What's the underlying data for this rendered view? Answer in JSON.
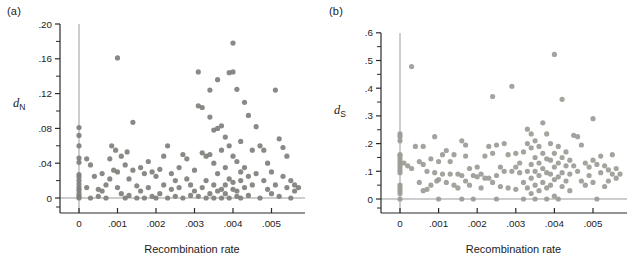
{
  "chart_data": [
    {
      "type": "scatter",
      "panel_label": "(a)",
      "xlabel": "Recombination rate",
      "ylabel_base": "d",
      "ylabel_sub": "N",
      "xlim": [
        -0.0005,
        0.0059
      ],
      "ylim": [
        -0.02,
        0.2
      ],
      "grid": false,
      "legend": "none",
      "zero_reference_lines": true,
      "xticks": {
        "values": [
          0,
          0.001,
          0.002,
          0.003,
          0.004,
          0.005
        ],
        "labels": [
          "0",
          ".001",
          ".002",
          ".003",
          ".004",
          ".005"
        ]
      },
      "yticks": {
        "values": [
          0,
          0.04,
          0.08,
          0.12,
          0.16,
          0.2
        ],
        "labels": [
          "0",
          ".04",
          ".08",
          ".12",
          ".16",
          ".20"
        ],
        "minor_step": 0.02
      },
      "dot_color": "#7f7f7b",
      "axis_color": "#2a2a2a",
      "zero_line_color": "#9b9b9b",
      "points": [
        [
          0,
          0.081
        ],
        [
          0,
          0.072
        ],
        [
          0,
          0.06
        ],
        [
          0,
          0.046
        ],
        [
          0,
          0.041
        ],
        [
          0,
          0.027
        ],
        [
          0,
          0.024
        ],
        [
          0,
          0.02
        ],
        [
          0,
          0.016
        ],
        [
          0,
          0.012
        ],
        [
          0,
          0.009
        ],
        [
          0,
          0.005
        ],
        [
          0,
          0.002
        ],
        [
          0,
          0.0
        ],
        [
          0.0002,
          0.045
        ],
        [
          0.0002,
          0.012
        ],
        [
          0.0003,
          0.038
        ],
        [
          0.0003,
          0.0
        ],
        [
          0.0004,
          0.025
        ],
        [
          0.0005,
          0.01
        ],
        [
          0.0005,
          0.002
        ],
        [
          0.0006,
          0.028
        ],
        [
          0.0006,
          0.008
        ],
        [
          0.0007,
          0.015
        ],
        [
          0.0007,
          0.0
        ],
        [
          0.0008,
          0.045
        ],
        [
          0.0008,
          0.022
        ],
        [
          0.00085,
          0.06
        ],
        [
          0.0009,
          0.032
        ],
        [
          0.00095,
          0.055
        ],
        [
          0.001,
          0.161
        ],
        [
          0.001,
          0.03
        ],
        [
          0.001,
          0.012
        ],
        [
          0.0011,
          0.048
        ],
        [
          0.0011,
          0.005
        ],
        [
          0.0012,
          0.038
        ],
        [
          0.0012,
          0.0
        ],
        [
          0.00125,
          0.053
        ],
        [
          0.0013,
          0.022
        ],
        [
          0.0013,
          0.003
        ],
        [
          0.0014,
          0.087
        ],
        [
          0.0014,
          0.032
        ],
        [
          0.0015,
          0.014
        ],
        [
          0.0015,
          0.0
        ],
        [
          0.0016,
          0.035
        ],
        [
          0.0016,
          0.008
        ],
        [
          0.0017,
          0.028
        ],
        [
          0.0017,
          0.0
        ],
        [
          0.0018,
          0.042
        ],
        [
          0.0018,
          0.012
        ],
        [
          0.0019,
          0.03
        ],
        [
          0.0019,
          0.002
        ],
        [
          0.002,
          0.025
        ],
        [
          0.002,
          0.0
        ],
        [
          0.0021,
          0.033
        ],
        [
          0.0021,
          0.005
        ],
        [
          0.0022,
          0.048
        ],
        [
          0.0022,
          0.015
        ],
        [
          0.0023,
          0.06
        ],
        [
          0.0023,
          0.0
        ],
        [
          0.0024,
          0.028
        ],
        [
          0.0024,
          0.01
        ],
        [
          0.0025,
          0.02
        ],
        [
          0.0025,
          0.002
        ],
        [
          0.0026,
          0.035
        ],
        [
          0.0026,
          0.012
        ],
        [
          0.0027,
          0.05
        ],
        [
          0.0027,
          0.0
        ],
        [
          0.0028,
          0.045
        ],
        [
          0.0028,
          0.022
        ],
        [
          0.0029,
          0.015
        ],
        [
          0.0029,
          0.003
        ],
        [
          0.003,
          0.032
        ],
        [
          0.003,
          0.008
        ],
        [
          0.0031,
          0.145
        ],
        [
          0.0031,
          0.106
        ],
        [
          0.0031,
          0.002
        ],
        [
          0.0032,
          0.104
        ],
        [
          0.0032,
          0.052
        ],
        [
          0.0032,
          0.012
        ],
        [
          0.0033,
          0.048
        ],
        [
          0.0033,
          0.02
        ],
        [
          0.0033,
          0.0
        ],
        [
          0.0034,
          0.124
        ],
        [
          0.0034,
          0.093
        ],
        [
          0.0034,
          0.05
        ],
        [
          0.0034,
          0.005
        ],
        [
          0.0035,
          0.078
        ],
        [
          0.0035,
          0.04
        ],
        [
          0.0035,
          0.015
        ],
        [
          0.0035,
          0.0
        ],
        [
          0.0036,
          0.136
        ],
        [
          0.0036,
          0.08
        ],
        [
          0.0036,
          0.028
        ],
        [
          0.0036,
          0.008
        ],
        [
          0.0037,
          0.083
        ],
        [
          0.0037,
          0.055
        ],
        [
          0.0037,
          0.01
        ],
        [
          0.0037,
          0.0
        ],
        [
          0.0038,
          0.07
        ],
        [
          0.0038,
          0.035
        ],
        [
          0.0038,
          0.015
        ],
        [
          0.0038,
          0.005
        ],
        [
          0.0039,
          0.144
        ],
        [
          0.0039,
          0.06
        ],
        [
          0.0039,
          0.022
        ],
        [
          0.0039,
          0.0
        ],
        [
          0.004,
          0.178
        ],
        [
          0.004,
          0.145
        ],
        [
          0.004,
          0.048
        ],
        [
          0.004,
          0.018
        ],
        [
          0.004,
          0.01
        ],
        [
          0.0041,
          0.125
        ],
        [
          0.0041,
          0.042
        ],
        [
          0.0041,
          0.008
        ],
        [
          0.0041,
          0.002
        ],
        [
          0.0042,
          0.065
        ],
        [
          0.0042,
          0.03
        ],
        [
          0.0042,
          0.02
        ],
        [
          0.0042,
          0.0
        ],
        [
          0.0043,
          0.11
        ],
        [
          0.0043,
          0.035
        ],
        [
          0.0043,
          0.012
        ],
        [
          0.0044,
          0.095
        ],
        [
          0.0044,
          0.025
        ],
        [
          0.0044,
          0.003
        ],
        [
          0.0045,
          0.055
        ],
        [
          0.0045,
          0.015
        ],
        [
          0.0046,
          0.082
        ],
        [
          0.0046,
          0.028
        ],
        [
          0.0047,
          0.06
        ],
        [
          0.0047,
          0.0
        ],
        [
          0.0048,
          0.055
        ],
        [
          0.0048,
          0.02
        ],
        [
          0.0049,
          0.04
        ],
        [
          0.0049,
          0.01
        ],
        [
          0.005,
          0.03
        ],
        [
          0.005,
          0.005
        ],
        [
          0.0051,
          0.124
        ],
        [
          0.0051,
          0.015
        ],
        [
          0.0052,
          0.068
        ],
        [
          0.0052,
          0.002
        ],
        [
          0.0053,
          0.058
        ],
        [
          0.0053,
          0.025
        ],
        [
          0.0054,
          0.048
        ],
        [
          0.0054,
          0.012
        ],
        [
          0.0055,
          0.02
        ],
        [
          0.0055,
          0.0
        ],
        [
          0.0056,
          0.015
        ],
        [
          0.0056,
          0.008
        ],
        [
          0.0057,
          0.012
        ]
      ]
    },
    {
      "type": "scatter",
      "panel_label": "(b)",
      "xlabel": "Recombination rate",
      "ylabel_base": "d",
      "ylabel_sub": "S",
      "xlim": [
        -0.0005,
        0.0059
      ],
      "ylim": [
        -0.06,
        0.6
      ],
      "grid": false,
      "legend": "none",
      "zero_reference_lines": true,
      "xticks": {
        "values": [
          0,
          0.001,
          0.002,
          0.003,
          0.004,
          0.005
        ],
        "labels": [
          "0",
          ".001",
          ".002",
          ".003",
          ".004",
          ".005"
        ]
      },
      "yticks": {
        "values": [
          0,
          0.1,
          0.2,
          0.3,
          0.4,
          0.5,
          0.6
        ],
        "labels": [
          "0",
          ".1",
          ".2",
          ".3",
          ".4",
          ".5",
          ".6"
        ],
        "minor_step": 0.05
      },
      "dot_color": "#9c9c96",
      "axis_color": "#2a2a2a",
      "zero_line_color": "#9b9b9b",
      "points": [
        [
          0,
          0.235
        ],
        [
          0,
          0.225
        ],
        [
          0,
          0.21
        ],
        [
          0,
          0.16
        ],
        [
          0,
          0.155
        ],
        [
          0,
          0.145
        ],
        [
          0,
          0.135
        ],
        [
          0,
          0.125
        ],
        [
          0,
          0.115
        ],
        [
          0,
          0.105
        ],
        [
          0,
          0.095
        ],
        [
          0,
          0.05
        ],
        [
          0,
          0.04
        ],
        [
          0,
          0.03
        ],
        [
          0,
          0.02
        ],
        [
          0,
          0.0
        ],
        [
          0.0001,
          0.13
        ],
        [
          0.0002,
          0.12
        ],
        [
          0.0003,
          0.478
        ],
        [
          0.0003,
          0.11
        ],
        [
          0.0004,
          0.19
        ],
        [
          0.0005,
          0.135
        ],
        [
          0.0005,
          0.06
        ],
        [
          0.0006,
          0.19
        ],
        [
          0.0006,
          0.125
        ],
        [
          0.0006,
          0.03
        ],
        [
          0.0007,
          0.1
        ],
        [
          0.0007,
          0.035
        ],
        [
          0.0008,
          0.145
        ],
        [
          0.0008,
          0.05
        ],
        [
          0.0009,
          0.225
        ],
        [
          0.0009,
          0.095
        ],
        [
          0.00095,
          0.065
        ],
        [
          0.001,
          0.135
        ],
        [
          0.001,
          0.07
        ],
        [
          0.001,
          0.0
        ],
        [
          0.0011,
          0.16
        ],
        [
          0.0011,
          0.09
        ],
        [
          0.0012,
          0.175
        ],
        [
          0.0012,
          0.06
        ],
        [
          0.0013,
          0.135
        ],
        [
          0.0013,
          0.09
        ],
        [
          0.0014,
          0.16
        ],
        [
          0.0014,
          0.05
        ],
        [
          0.0015,
          0.09
        ],
        [
          0.0015,
          0.04
        ],
        [
          0.0016,
          0.21
        ],
        [
          0.0016,
          0.085
        ],
        [
          0.0016,
          0.0
        ],
        [
          0.0017,
          0.195
        ],
        [
          0.0017,
          0.155
        ],
        [
          0.0017,
          0.065
        ],
        [
          0.0018,
          0.11
        ],
        [
          0.0018,
          0.05
        ],
        [
          0.0019,
          0.085
        ],
        [
          0.0019,
          0.0
        ],
        [
          0.002,
          0.115
        ],
        [
          0.002,
          0.08
        ],
        [
          0.0021,
          0.09
        ],
        [
          0.0021,
          0.04
        ],
        [
          0.0022,
          0.155
        ],
        [
          0.0022,
          0.075
        ],
        [
          0.0023,
          0.19
        ],
        [
          0.0023,
          0.075
        ],
        [
          0.0024,
          0.37
        ],
        [
          0.0024,
          0.165
        ],
        [
          0.0024,
          0.06
        ],
        [
          0.0025,
          0.195
        ],
        [
          0.0025,
          0.085
        ],
        [
          0.0025,
          0.0
        ],
        [
          0.0026,
          0.115
        ],
        [
          0.0026,
          0.045
        ],
        [
          0.0027,
          0.2
        ],
        [
          0.0027,
          0.1
        ],
        [
          0.0028,
          0.16
        ],
        [
          0.0028,
          0.04
        ],
        [
          0.0029,
          0.407
        ],
        [
          0.0029,
          0.1
        ],
        [
          0.003,
          0.165
        ],
        [
          0.003,
          0.115
        ],
        [
          0.003,
          0.035
        ],
        [
          0.0031,
          0.13
        ],
        [
          0.0031,
          0.095
        ],
        [
          0.0032,
          0.17
        ],
        [
          0.0032,
          0.06
        ],
        [
          0.0032,
          0.0
        ],
        [
          0.0033,
          0.252
        ],
        [
          0.0033,
          0.2
        ],
        [
          0.0033,
          0.1
        ],
        [
          0.0033,
          0.04
        ],
        [
          0.0034,
          0.235
        ],
        [
          0.0034,
          0.185
        ],
        [
          0.0034,
          0.125
        ],
        [
          0.0034,
          0.075
        ],
        [
          0.0034,
          0.02
        ],
        [
          0.0035,
          0.21
        ],
        [
          0.0035,
          0.15
        ],
        [
          0.0035,
          0.1
        ],
        [
          0.0035,
          0.05
        ],
        [
          0.0035,
          0.0
        ],
        [
          0.0036,
          0.19
        ],
        [
          0.0036,
          0.13
        ],
        [
          0.0036,
          0.085
        ],
        [
          0.0036,
          0.03
        ],
        [
          0.0037,
          0.275
        ],
        [
          0.0037,
          0.165
        ],
        [
          0.0037,
          0.11
        ],
        [
          0.0037,
          0.06
        ],
        [
          0.0038,
          0.235
        ],
        [
          0.0038,
          0.145
        ],
        [
          0.0038,
          0.095
        ],
        [
          0.0038,
          0.04
        ],
        [
          0.0038,
          0.0
        ],
        [
          0.0039,
          0.2
        ],
        [
          0.0039,
          0.14
        ],
        [
          0.0039,
          0.09
        ],
        [
          0.0039,
          0.05
        ],
        [
          0.004,
          0.522
        ],
        [
          0.004,
          0.165
        ],
        [
          0.004,
          0.115
        ],
        [
          0.004,
          0.07
        ],
        [
          0.004,
          0.01
        ],
        [
          0.0041,
          0.19
        ],
        [
          0.0041,
          0.13
        ],
        [
          0.0041,
          0.08
        ],
        [
          0.0041,
          0.0
        ],
        [
          0.0042,
          0.36
        ],
        [
          0.0042,
          0.15
        ],
        [
          0.0042,
          0.095
        ],
        [
          0.0042,
          0.045
        ],
        [
          0.0043,
          0.17
        ],
        [
          0.0043,
          0.12
        ],
        [
          0.0043,
          0.065
        ],
        [
          0.0044,
          0.14
        ],
        [
          0.0044,
          0.09
        ],
        [
          0.0044,
          0.03
        ],
        [
          0.0045,
          0.23
        ],
        [
          0.0045,
          0.12
        ],
        [
          0.0046,
          0.225
        ],
        [
          0.0046,
          0.1
        ],
        [
          0.0047,
          0.195
        ],
        [
          0.0047,
          0.065
        ],
        [
          0.0048,
          0.13
        ],
        [
          0.0048,
          0.05
        ],
        [
          0.0049,
          0.115
        ],
        [
          0.0049,
          0.085
        ],
        [
          0.005,
          0.29
        ],
        [
          0.005,
          0.14
        ],
        [
          0.005,
          0.06
        ],
        [
          0.0051,
          0.125
        ],
        [
          0.0051,
          0.0
        ],
        [
          0.0052,
          0.155
        ],
        [
          0.0052,
          0.095
        ],
        [
          0.0053,
          0.12
        ],
        [
          0.0053,
          0.045
        ],
        [
          0.0054,
          0.105
        ],
        [
          0.0054,
          0.065
        ],
        [
          0.0055,
          0.16
        ],
        [
          0.0055,
          0.09
        ],
        [
          0.0056,
          0.11
        ],
        [
          0.0056,
          0.075
        ],
        [
          0.0057,
          0.09
        ]
      ]
    }
  ]
}
